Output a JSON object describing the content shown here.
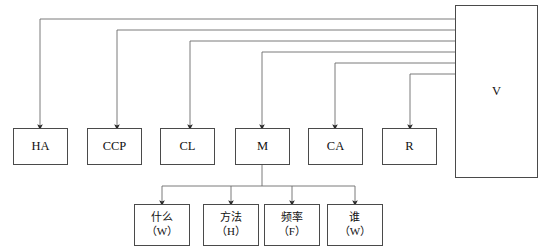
{
  "diagram": {
    "type": "block-flow-diagram",
    "canvas": {
      "width": 549,
      "height": 252,
      "background": "#ffffff"
    },
    "line_color": "#6b6b6b",
    "border_color": "#4a4a4a",
    "vessel": {
      "id": "V",
      "label": "V",
      "x": 455,
      "y": 5,
      "w": 83,
      "h": 173
    },
    "top_nodes": [
      {
        "id": "HA",
        "label": "HA",
        "x": 13,
        "y": 128,
        "w": 55,
        "h": 37
      },
      {
        "id": "CCP",
        "label": "CCP",
        "x": 87,
        "y": 128,
        "w": 55,
        "h": 37
      },
      {
        "id": "CL",
        "label": "CL",
        "x": 160,
        "y": 128,
        "w": 55,
        "h": 37
      },
      {
        "id": "M",
        "label": "M",
        "x": 235,
        "y": 128,
        "w": 55,
        "h": 37
      },
      {
        "id": "CA",
        "label": "CA",
        "x": 308,
        "y": 128,
        "w": 55,
        "h": 37
      },
      {
        "id": "R",
        "label": "R",
        "x": 382,
        "y": 128,
        "w": 55,
        "h": 37
      }
    ],
    "leaf_nodes": [
      {
        "id": "what",
        "line1": "什么",
        "line2": "（W）",
        "x": 134,
        "y": 204,
        "w": 56,
        "h": 42
      },
      {
        "id": "how",
        "line1": "方法",
        "line2": "（H）",
        "x": 203,
        "y": 204,
        "w": 56,
        "h": 42
      },
      {
        "id": "frequency",
        "line1": "频率",
        "line2": "（F）",
        "x": 264,
        "y": 204,
        "w": 56,
        "h": 42
      },
      {
        "id": "who",
        "line1": "谁",
        "line2": "（W）",
        "x": 327,
        "y": 204,
        "w": 56,
        "h": 42
      }
    ],
    "vessel_feeds": [
      {
        "target": "HA",
        "bus_y": 19,
        "drop_x": 40
      },
      {
        "target": "CCP",
        "bus_y": 30,
        "drop_x": 117
      },
      {
        "target": "CL",
        "bus_y": 41,
        "drop_x": 190
      },
      {
        "target": "M",
        "bus_y": 52,
        "drop_x": 262
      },
      {
        "target": "CA",
        "bus_y": 63,
        "drop_x": 335
      },
      {
        "target": "R",
        "bus_y": 74,
        "drop_x": 410
      }
    ],
    "m_branch": {
      "source": "M",
      "stem_x": 262,
      "stem_top_y": 165,
      "bus_y": 186,
      "targets_x": [
        162,
        231,
        292,
        355
      ]
    }
  }
}
